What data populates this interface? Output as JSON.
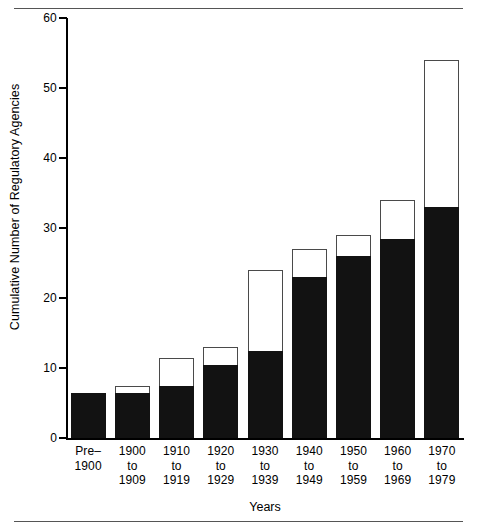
{
  "figure": {
    "has_top_rule": true,
    "has_bottom_rule": true
  },
  "chart_data": {
    "type": "bar",
    "title": "",
    "xlabel": "Years",
    "ylabel": "Cumulative Number of Regulatory Agencies",
    "ylim": [
      0,
      60
    ],
    "yticks": [
      0,
      10,
      20,
      30,
      40,
      50,
      60
    ],
    "ytick_labels": [
      "0",
      "10",
      "20",
      "30",
      "40",
      "50",
      "60"
    ],
    "grid": false,
    "legend": "none",
    "stacked": true,
    "categories": [
      "Pre–\n1900",
      "1900\nto\n1909",
      "1910\nto\n1919",
      "1920\nto\n1929",
      "1930\nto\n1939",
      "1940\nto\n1949",
      "1950\nto\n1959",
      "1960\nto\n1969",
      "1970\nto\n1979"
    ],
    "category_lines": [
      [
        "Pre–",
        "1900"
      ],
      [
        "1900",
        "to",
        "1909"
      ],
      [
        "1910",
        "to",
        "1919"
      ],
      [
        "1920",
        "to",
        "1929"
      ],
      [
        "1930",
        "to",
        "1939"
      ],
      [
        "1940",
        "to",
        "1949"
      ],
      [
        "1950",
        "to",
        "1959"
      ],
      [
        "1960",
        "to",
        "1969"
      ],
      [
        "1970",
        "to",
        "1979"
      ]
    ],
    "series": [
      {
        "name": "filled",
        "color": "#121212",
        "values": [
          6.5,
          6.5,
          7.5,
          10.5,
          12.5,
          23,
          26,
          28.5,
          33
        ]
      },
      {
        "name": "total",
        "color": "#ffffff",
        "outline": "#4a4a4a",
        "values": [
          6.5,
          7.5,
          11.5,
          13,
          24,
          27,
          29,
          34,
          54
        ]
      }
    ]
  },
  "colors": {
    "filled": "#121212",
    "outline": "#4a4a4a",
    "background": "#ffffff",
    "axis": "#000000",
    "rule": "#555555"
  }
}
